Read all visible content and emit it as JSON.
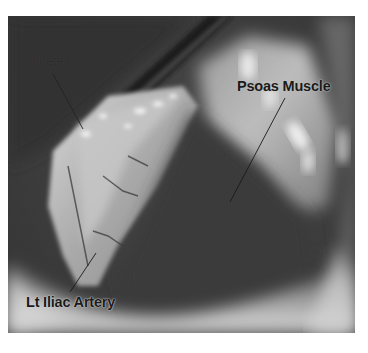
{
  "figure": {
    "type": "laparoscopic-surgical-photograph",
    "color_mode": "grayscale",
    "labels": [
      {
        "id": "ureter",
        "text": "Ureter"
      },
      {
        "id": "psoas",
        "text": "Psoas Muscle"
      },
      {
        "id": "iliac",
        "text": "Lt Iliac Artery"
      }
    ]
  },
  "colors": {
    "background": "#ffffff",
    "photo_dark": "#2e2e2e",
    "photo_mid": "#6a6a6a",
    "photo_light": "#d8d8d8",
    "label_text": "#1a1a1a",
    "leader_line": "#1a1a1a"
  }
}
